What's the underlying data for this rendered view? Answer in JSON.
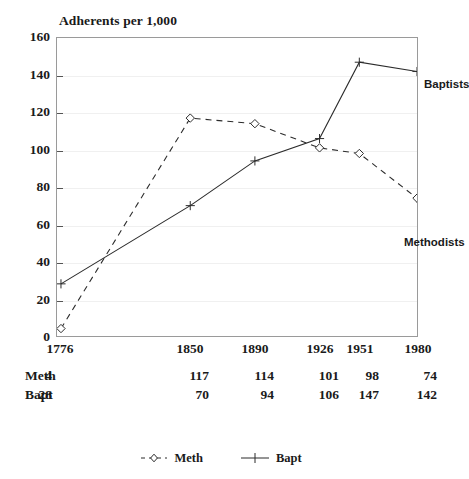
{
  "chart_data": {
    "type": "line",
    "title": "Adherents per 1,000",
    "xlabel": "",
    "ylabel": "",
    "categories": [
      "1776",
      "1850",
      "1890",
      "1926",
      "1951",
      "1980"
    ],
    "x": [
      1776,
      1850,
      1890,
      1926,
      1951,
      1980
    ],
    "series": [
      {
        "name": "Meth",
        "legend_label": "Meth",
        "annotation": "Methodists",
        "marker": "diamond",
        "linestyle": "dashed",
        "color": "#2b2b2b",
        "values": [
          4,
          117,
          114,
          101,
          98,
          74
        ]
      },
      {
        "name": "Bapt",
        "legend_label": "Bapt",
        "annotation": "Baptists",
        "marker": "plus",
        "linestyle": "solid",
        "color": "#2b2b2b",
        "values": [
          28,
          70,
          94,
          106,
          147,
          142
        ]
      }
    ],
    "ylim": [
      0,
      160
    ],
    "yticks": [
      0,
      20,
      40,
      60,
      80,
      100,
      120,
      140,
      160
    ],
    "ytick_labels": [
      "0",
      "20",
      "40",
      "60",
      "80",
      "100",
      "120",
      "140",
      "160"
    ],
    "grid": true,
    "grid_axis": "y",
    "legend_position": "bottom-center"
  },
  "table": {
    "rows": [
      {
        "label": "Meth",
        "values": [
          "4",
          "117",
          "114",
          "101",
          "98",
          "74"
        ]
      },
      {
        "label": "Bapt",
        "values": [
          "28",
          "70",
          "94",
          "106",
          "147",
          "142"
        ]
      }
    ]
  },
  "colors": {
    "line": "#2b2b2b",
    "axis": "#9a9a9a",
    "grid": "#f0f0f0",
    "text": "#1a1a1a",
    "background": "#ffffff"
  }
}
